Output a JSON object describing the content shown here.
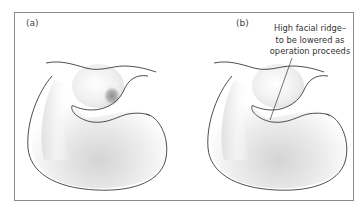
{
  "figure": {
    "panels": [
      {
        "id": "a",
        "label": "(a)"
      },
      {
        "id": "b",
        "label": "(b)"
      }
    ],
    "annotation": {
      "line1": "High facial ridge–",
      "line2": "to be lowered as",
      "line3": "operation proceeds"
    },
    "colors": {
      "outline": "#3a3a3a",
      "frame": "#8a8a8a",
      "shade": "#cfcfcf",
      "dark_spot": "#8e8e8e"
    }
  }
}
